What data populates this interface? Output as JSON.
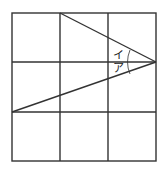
{
  "diagram": {
    "type": "grid-with-angles",
    "grid": {
      "rows": 3,
      "cols": 3
    },
    "labels": {
      "angle_upper": "イ",
      "angle_lower": "ア"
    },
    "colors": {
      "line": "#333333",
      "background": "#ffffff"
    }
  }
}
